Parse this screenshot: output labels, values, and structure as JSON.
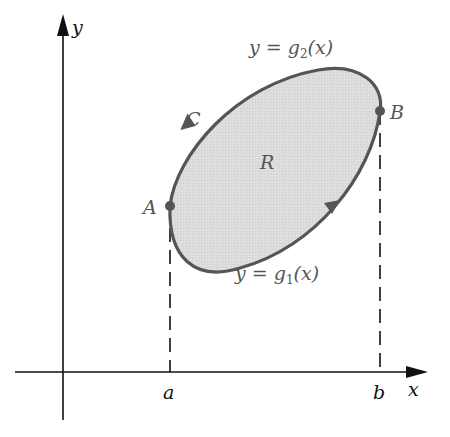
{
  "figure": {
    "axes": {
      "x_label": "x",
      "y_label": "y",
      "x_ticks": [
        "a",
        "b"
      ]
    },
    "region_label": "R",
    "curve_label": "C",
    "points": {
      "A": "A",
      "B": "B"
    },
    "upper_curve": {
      "prefix": "y = g",
      "sub": "2",
      "suffix": "(x)"
    },
    "lower_curve": {
      "prefix": "y = g",
      "sub": "1",
      "suffix": "(x)"
    },
    "colors": {
      "region_fill": "#d9d9d9",
      "boundary": "#555555",
      "axes": "#111111",
      "background": "#ffffff"
    }
  }
}
